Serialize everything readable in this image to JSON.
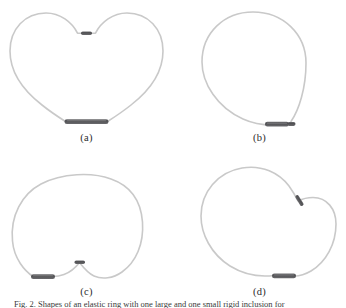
{
  "figure": {
    "background": "#ffffff",
    "filament_color": "#c9c9c9",
    "filament_width": 1.6,
    "bar_color": "#58585a",
    "bar_highlight": "#8d8d90",
    "label_color": "#2b2b2b",
    "caption_prefix": "Fig. 2.",
    "caption_text": "Fig. 2. Shapes of an elastic ring with one large and one small rigid inclusion for"
  },
  "panels": [
    {
      "id": "a",
      "label": "(a)",
      "name": "heart-shaped-loop",
      "description": "Closed elastic loop forming a heart shape with a cusp at the top",
      "bars": [
        {
          "name": "large-bar",
          "position": "bottom-center",
          "length": 24,
          "thickness": 4.6,
          "angle": 0
        },
        {
          "name": "small-bar",
          "position": "top-center-notch",
          "length": 11,
          "thickness": 3.4,
          "angle": 0
        }
      ]
    },
    {
      "id": "b",
      "label": "(b)",
      "name": "circular-loop",
      "description": "Closed elastic loop forming a nearly circular shape",
      "bars": [
        {
          "name": "large-bar",
          "position": "bottom-right",
          "length": 24,
          "thickness": 4.6,
          "angle": 0
        },
        {
          "name": "small-bar",
          "position": "bottom-right-end",
          "length": 8,
          "thickness": 3.2,
          "angle": 0
        }
      ]
    },
    {
      "id": "c",
      "label": "(c)",
      "name": "bulbous-loop-with-notch",
      "description": "Closed elastic loop forming a wide bulbous shape with a small downward cusp at bottom center",
      "bars": [
        {
          "name": "large-bar",
          "position": "bottom-left",
          "length": 24,
          "thickness": 4.6,
          "angle": 0
        },
        {
          "name": "small-bar",
          "position": "bottom-center-notch",
          "length": 10,
          "thickness": 3.4,
          "angle": 0
        }
      ]
    },
    {
      "id": "d",
      "label": "(d)",
      "name": "asymmetric-loop-with-kink",
      "description": "Closed elastic loop with an asymmetric teardrop shape and a tilted inclusion on the upper right",
      "bars": [
        {
          "name": "large-bar",
          "position": "bottom-center",
          "length": 24,
          "thickness": 4.6,
          "angle": 0
        },
        {
          "name": "small-bar",
          "position": "upper-right-kink",
          "length": 11,
          "thickness": 3.4,
          "angle": 58
        }
      ]
    }
  ]
}
